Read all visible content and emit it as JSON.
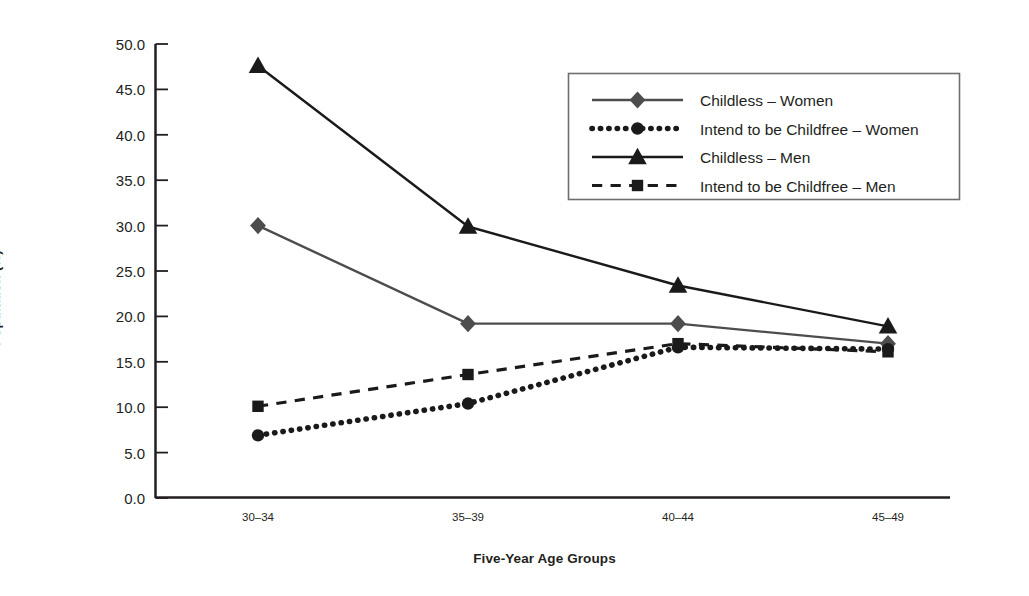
{
  "chart_data": {
    "type": "line",
    "title": "",
    "xlabel": "Five-Year Age Groups",
    "ylabel": "Population (%)",
    "categories": [
      "30–34",
      "35–39",
      "40–44",
      "45–49"
    ],
    "ylim": [
      0.0,
      50.0
    ],
    "ytick_step": 5.0,
    "ytick_labels": [
      "0.0",
      "5.0",
      "10.0",
      "15.0",
      "20.0",
      "25.0",
      "30.0",
      "35.0",
      "40.0",
      "45.0",
      "50.0"
    ],
    "grid": false,
    "legend_position": "upper-right",
    "series": [
      {
        "name": "Childless – Women",
        "marker": "diamond",
        "linestyle": "solid",
        "color": "#4d4d4d",
        "values": [
          30.0,
          19.2,
          19.2,
          17.0
        ]
      },
      {
        "name": "Intend to be Childfree – Women",
        "marker": "circle",
        "linestyle": "dotted",
        "color": "#1a1a1a",
        "values": [
          6.9,
          10.4,
          16.6,
          16.4
        ]
      },
      {
        "name": "Childless – Men",
        "marker": "triangle",
        "linestyle": "solid",
        "color": "#1a1a1a",
        "values": [
          47.6,
          29.9,
          23.4,
          18.9
        ]
      },
      {
        "name": "Intend to be Childfree – Men",
        "marker": "square",
        "linestyle": "dashed",
        "color": "#1a1a1a",
        "values": [
          10.1,
          13.6,
          17.0,
          16.1
        ]
      }
    ]
  },
  "axes": {
    "y_title": "Population (%)",
    "x_title": "Five-Year Age Groups"
  }
}
